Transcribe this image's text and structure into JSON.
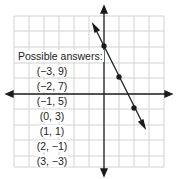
{
  "diagram": {
    "type": "coordinate-grid",
    "grid": {
      "x_range": [
        -6,
        4
      ],
      "y_range": [
        -5,
        5
      ],
      "line_color": "#cfcfcf",
      "axis_color": "#1a1a1a"
    },
    "line": {
      "equation": "y = -2x + 3",
      "points": [
        [
          0,
          3
        ],
        [
          1,
          1
        ],
        [
          2,
          -1
        ]
      ],
      "color": "#1a1a1a"
    }
  },
  "answers": {
    "title": "Possible answers:",
    "items": [
      "(−3, 9)",
      "(−2, 7)",
      "(−1, 5)",
      "(0, 3)",
      "(1, 1)",
      "(2, −1)",
      "(3, −3)"
    ]
  }
}
